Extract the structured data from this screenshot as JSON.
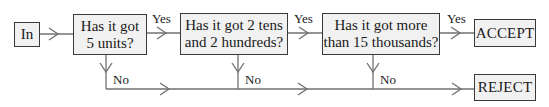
{
  "diagram": {
    "type": "flowchart",
    "colors": {
      "box_fill": "#f1f1f1",
      "box_border": "#3a3a3a",
      "connector": "#707070",
      "text": "#1a1a1a"
    },
    "nodes": {
      "input": {
        "label": "In"
      },
      "q1": {
        "label": "Has it got\n5 units?"
      },
      "q2": {
        "label": "Has it got 2 tens\nand 2 hundreds?"
      },
      "q3": {
        "label": "Has it got more\nthan 15 thousands?"
      },
      "accept": {
        "label": "ACCEPT"
      },
      "reject": {
        "label": "REJECT"
      }
    },
    "edges": {
      "yes_label": "Yes",
      "no_label": "No",
      "q1_yes": "Yes",
      "q2_yes": "Yes",
      "q3_yes": "Yes",
      "q1_no": "No",
      "q2_no": "No",
      "q3_no": "No"
    }
  }
}
